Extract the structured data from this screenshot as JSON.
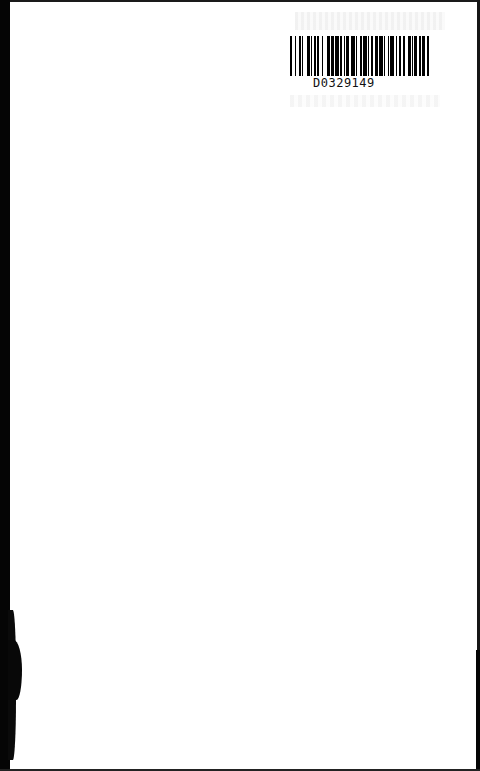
{
  "page": {
    "type": "scanned-book-page",
    "background": "#ffffff",
    "edge_color": "#050505"
  },
  "barcode": {
    "label": "D0329149",
    "bar_color": "#000000",
    "pattern": [
      2,
      2,
      1,
      2,
      2,
      1,
      1,
      3,
      2,
      1,
      1,
      2,
      1,
      1,
      2,
      2,
      1,
      3,
      3,
      1,
      2,
      1,
      3,
      1,
      2,
      1,
      1,
      1,
      2,
      2,
      3,
      1,
      1,
      2,
      2,
      1,
      3,
      1,
      1,
      1,
      2,
      2,
      2,
      1,
      3,
      1,
      1,
      2,
      1,
      1,
      3,
      2,
      1,
      1,
      2,
      2,
      1,
      3,
      2,
      1,
      1,
      1,
      2,
      2,
      1,
      1,
      3,
      1,
      2,
      2
    ]
  }
}
